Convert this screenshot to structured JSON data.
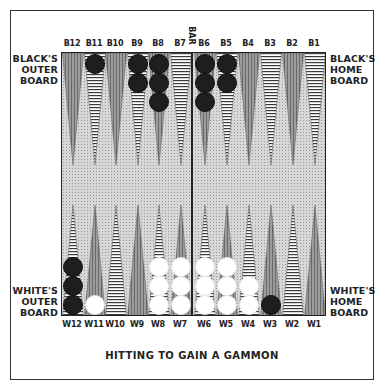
{
  "title": "HITTING TO GAIN A GAMMON",
  "labels": {
    "black_outer": "BLACK'S\nOUTER\nBOARD",
    "black_home": "BLACK'S\nHOME\nBOARD",
    "white_outer": "WHITE'S\nOUTER\nBOARD",
    "white_home": "WHITE'S\nHOME\nBOARD",
    "bar": "BAR"
  },
  "label_lines": {
    "black_outer": [
      "BLACK'S",
      "OUTER",
      "BOARD"
    ],
    "black_home": [
      "BLACK'S",
      "HOME",
      "BOARD"
    ],
    "white_outer": [
      "WHITE'S",
      "OUTER",
      "BOARD"
    ],
    "white_home": [
      "WHITE'S",
      "HOME",
      "BOARD"
    ]
  },
  "top_points": [
    {
      "label": "B12",
      "x": 72,
      "style": "dark",
      "black": 0,
      "white": 0
    },
    {
      "label": "B11",
      "x": 94,
      "style": "light",
      "black": 1,
      "white": 0
    },
    {
      "label": "B10",
      "x": 115,
      "style": "dark",
      "black": 0,
      "white": 0
    },
    {
      "label": "B9",
      "x": 137,
      "style": "light",
      "black": 2,
      "white": 0
    },
    {
      "label": "B8",
      "x": 158,
      "style": "dark",
      "black": 3,
      "white": 0
    },
    {
      "label": "B7",
      "x": 180,
      "style": "light",
      "black": 0,
      "white": 0
    },
    {
      "label": "B6",
      "x": 204,
      "style": "dark",
      "black": 3,
      "white": 0
    },
    {
      "label": "B5",
      "x": 226,
      "style": "light",
      "black": 2,
      "white": 0
    },
    {
      "label": "B4",
      "x": 248,
      "style": "dark",
      "black": 0,
      "white": 0
    },
    {
      "label": "B3",
      "x": 270,
      "style": "light",
      "black": 0,
      "white": 0
    },
    {
      "label": "B2",
      "x": 292,
      "style": "dark",
      "black": 0,
      "white": 0
    },
    {
      "label": "B1",
      "x": 314,
      "style": "light",
      "black": 0,
      "white": 0
    }
  ],
  "bottom_points": [
    {
      "label": "W12",
      "x": 72,
      "style": "light",
      "black": 3,
      "white": 0
    },
    {
      "label": "W11",
      "x": 94,
      "style": "dark",
      "black": 0,
      "white": 1
    },
    {
      "label": "W10",
      "x": 115,
      "style": "light",
      "black": 0,
      "white": 0
    },
    {
      "label": "W9",
      "x": 137,
      "style": "dark",
      "black": 0,
      "white": 0
    },
    {
      "label": "W8",
      "x": 158,
      "style": "light",
      "black": 0,
      "white": 3
    },
    {
      "label": "W7",
      "x": 180,
      "style": "dark",
      "black": 0,
      "white": 3
    },
    {
      "label": "W6",
      "x": 204,
      "style": "light",
      "black": 0,
      "white": 3
    },
    {
      "label": "W5",
      "x": 226,
      "style": "dark",
      "black": 0,
      "white": 3
    },
    {
      "label": "W4",
      "x": 248,
      "style": "light",
      "black": 0,
      "white": 2
    },
    {
      "label": "W3",
      "x": 270,
      "style": "dark",
      "black": 1,
      "white": 0
    },
    {
      "label": "W2",
      "x": 292,
      "style": "light",
      "black": 0,
      "white": 0
    },
    {
      "label": "W1",
      "x": 314,
      "style": "dark",
      "black": 0,
      "white": 0
    }
  ],
  "colors": {
    "board_bg": "#d7d7d7",
    "point_dark": "#8c8c8c",
    "point_light": "#ffffff",
    "stripe": "#333333",
    "black_checker": "#1e1e1e",
    "white_checker": "#ffffff"
  }
}
